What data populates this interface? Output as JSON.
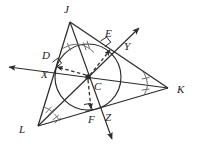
{
  "figure": {
    "name": "triangle-incenter-incircle",
    "background": "#ffffff",
    "stroke": "#2b2b2b",
    "label_color": "#1b1b1b"
  },
  "vertices": [
    {
      "id": "J",
      "label": "J",
      "x": 70,
      "y": 22,
      "label_x": 64,
      "label_y": 4
    },
    {
      "id": "K",
      "label": "K",
      "x": 168,
      "y": 88,
      "label_x": 177,
      "label_y": 84
    },
    {
      "id": "L",
      "label": "L",
      "x": 38,
      "y": 126,
      "label_x": 19,
      "label_y": 124
    }
  ],
  "center": {
    "id": "C",
    "label": "C",
    "x": 88,
    "y": 77,
    "label_x": 94,
    "label_y": 82
  },
  "tangent_points": [
    {
      "id": "D",
      "label": "D",
      "x": 51,
      "y": 66,
      "label_x": 42,
      "label_y": 50,
      "side": "JL"
    },
    {
      "id": "E",
      "label": "E",
      "x": 113,
      "y": 45,
      "label_x": 105,
      "label_y": 29,
      "side": "JK"
    },
    {
      "id": "F",
      "label": "F",
      "x": 91,
      "y": 114,
      "label_x": 88,
      "label_y": 114,
      "side": "LK"
    }
  ],
  "ray_endpoints": [
    {
      "id": "X",
      "label": "X",
      "x": 5,
      "y": 67,
      "label_x": 42,
      "label_y": 69,
      "from": "K"
    },
    {
      "id": "Y",
      "label": "Y",
      "x": 142,
      "y": 25,
      "label_x": 124,
      "label_y": 41,
      "from": "L"
    },
    {
      "id": "Z",
      "label": "Z",
      "x": 112,
      "y": 142,
      "label_x": 105,
      "label_y": 112,
      "from": "J"
    }
  ],
  "incircle": {
    "cx": 88,
    "cy": 77,
    "r": 33
  },
  "angle_marks": [
    {
      "vertex": "J",
      "ticks": 1,
      "style": "single-tick-pair"
    },
    {
      "vertex": "K",
      "ticks": 3,
      "style": "triple-tick-pair"
    },
    {
      "vertex": "L",
      "ticks": 2,
      "style": "double-tick-pair"
    }
  ],
  "right_angle_marks": [
    {
      "at": "D",
      "x": 57,
      "y": 60
    },
    {
      "at": "E",
      "x": 103,
      "y": 45
    },
    {
      "at": "F",
      "x": 88,
      "y": 106
    }
  ],
  "radii": [
    {
      "from": "C",
      "to": "D",
      "style": "dashed-arrow"
    },
    {
      "from": "C",
      "to": "E",
      "style": "dashed-arrow"
    },
    {
      "from": "C",
      "to": "F",
      "style": "dashed-arrow"
    }
  ]
}
